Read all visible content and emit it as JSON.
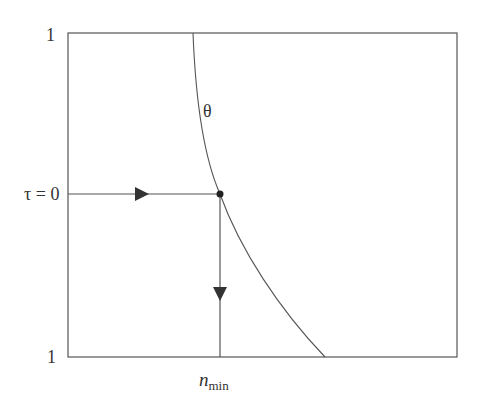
{
  "diagram": {
    "labels": {
      "y_top": "1",
      "y_bottom": "1",
      "tau_label": "τ = 0",
      "curve_label": "θ",
      "x_label_main": "n",
      "x_label_sub": "min"
    },
    "colors": {
      "line": "#555555",
      "arrow": "#333333",
      "point": "#222222",
      "background": "#ffffff"
    },
    "frame": {
      "left": 68,
      "top": 33,
      "right": 457,
      "bottom": 357
    },
    "curve": {
      "start": [
        193,
        33
      ],
      "end": [
        325,
        357
      ],
      "passes_through": [
        220,
        194
      ]
    },
    "horizontal_path": {
      "from": [
        68,
        194
      ],
      "to": [
        220,
        194
      ],
      "arrow_direction": "right"
    },
    "vertical_path": {
      "from": [
        220,
        194
      ],
      "to": [
        220,
        357
      ],
      "arrow_direction": "down"
    }
  }
}
